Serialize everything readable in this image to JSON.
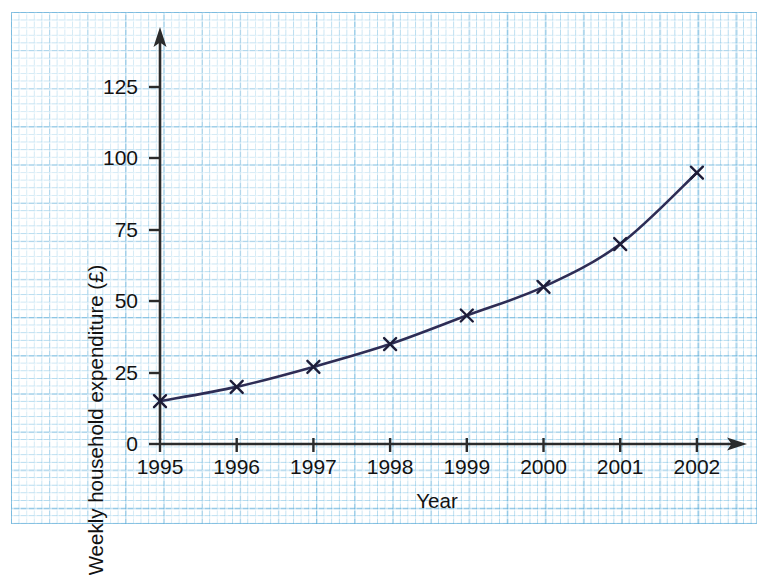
{
  "chart_data": {
    "type": "line",
    "title": "",
    "subtitle": "",
    "xlabel": "Year",
    "ylabel": "Weekly household expenditure (£)",
    "x": [
      "1995",
      "1996",
      "1997",
      "1998",
      "1999",
      "2000",
      "2001",
      "2002"
    ],
    "categories": [
      "1995",
      "1996",
      "1997",
      "1998",
      "1999",
      "2000",
      "2001",
      "2002"
    ],
    "values": [
      15,
      20,
      27,
      35,
      45,
      55,
      70,
      95
    ],
    "series": [
      {
        "name": "Weekly household expenditure",
        "values": [
          15,
          20,
          27,
          35,
          45,
          55,
          70,
          95
        ]
      }
    ],
    "ylim": [
      0,
      137
    ],
    "xlim": [
      "1995",
      "2002"
    ],
    "y_ticks": [
      0,
      25,
      50,
      75,
      100,
      125
    ],
    "y_tick_labels": [
      "0",
      "25",
      "50",
      "75",
      "100",
      "125"
    ],
    "x_tick_labels": [
      "1995",
      "1996",
      "1997",
      "1998",
      "1999",
      "2000",
      "2001",
      "2002"
    ],
    "grid": true,
    "grid_style": "graph-paper",
    "legend": false,
    "legend_position": "none",
    "marker": "x-cross",
    "line_color": "#2e2d55",
    "marker_color": "#1d1c38",
    "axis_color": "#2b2b2b",
    "grid_color": "#56a8d6",
    "background_color": "#ffffff",
    "x_axis_arrow": true,
    "y_axis_arrow": true,
    "annotations": []
  },
  "axes": {
    "y_title": "Weekly household expenditure (£)",
    "x_title": "Year",
    "y_ticks": [
      {
        "label": "125",
        "value": 125
      },
      {
        "label": "100",
        "value": 100
      },
      {
        "label": "75",
        "value": 75
      },
      {
        "label": "50",
        "value": 50
      },
      {
        "label": "25",
        "value": 25
      },
      {
        "label": "0",
        "value": 0
      }
    ],
    "x_ticks": [
      {
        "label": "1995"
      },
      {
        "label": "1996"
      },
      {
        "label": "1997"
      },
      {
        "label": "1998"
      },
      {
        "label": "1999"
      },
      {
        "label": "2000"
      },
      {
        "label": "2001"
      },
      {
        "label": "2002"
      }
    ]
  }
}
